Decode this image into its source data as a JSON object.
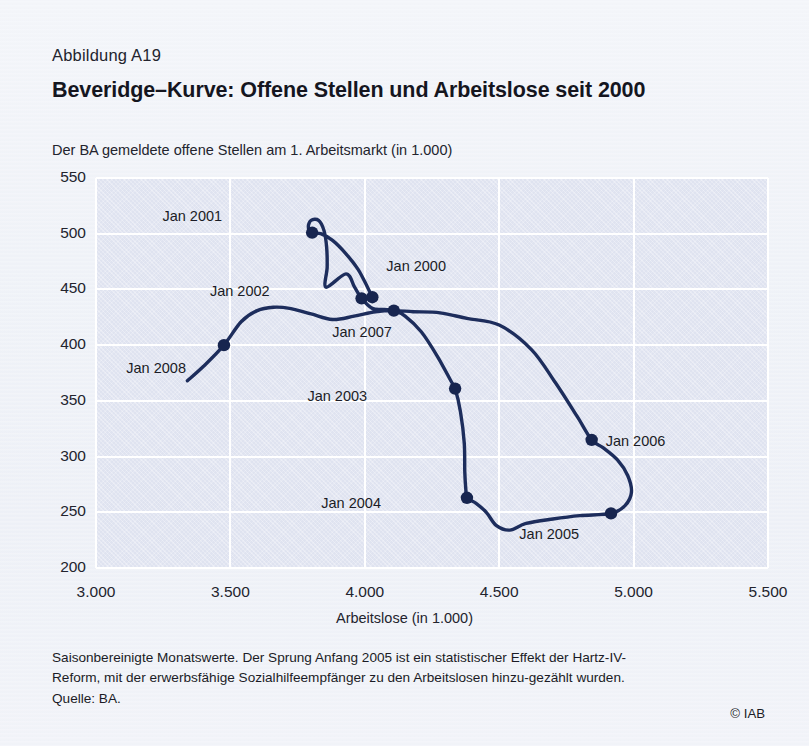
{
  "figure": {
    "number": "Abbildung A19",
    "title": "Beveridge–Kurve: Offene Stellen und Arbeitslose seit 2000",
    "y_axis_title": "Der BA gemeldete offene Stellen am 1. Arbeitsmarkt (in 1.000)",
    "x_axis_title": "Arbeitslose (in 1.000)",
    "footnote_line1": "Saisonbereinigte Monatswerte. Der Sprung Anfang 2005 ist ein statistischer Effekt der Hartz-IV-",
    "footnote_line2": "Reform, mit der erwerbsfähige Sozialhilfeempfänger zu den Arbeitslosen hinzu-gezählt wurden.",
    "source": "Quelle: BA.",
    "copyright": "© IAB"
  },
  "colors": {
    "curve": "#1d2d5c",
    "marker": "#17254f",
    "plot_background": "#dfe3f0",
    "gridline": "#ffffff",
    "page_background": "#eef1f7",
    "text": "#1b1c26"
  },
  "chart_data": {
    "type": "line",
    "title": "Beveridge–Kurve: Offene Stellen und Arbeitslose seit 2000",
    "xlabel": "Arbeitslose (in 1.000)",
    "ylabel": "Der BA gemeldete offene Stellen am 1. Arbeitsmarkt (in 1.000)",
    "xlim": [
      3000,
      5500
    ],
    "ylim": [
      200,
      550
    ],
    "xticks": [
      "3.000",
      "3.500",
      "4.000",
      "4.500",
      "5.000",
      "5.500"
    ],
    "xtick_values": [
      3000,
      3500,
      4000,
      4500,
      5000,
      5500
    ],
    "yticks": [
      "200",
      "250",
      "300",
      "350",
      "400",
      "450",
      "500",
      "550"
    ],
    "ytick_values": [
      200,
      250,
      300,
      350,
      400,
      450,
      500,
      550
    ],
    "grid": true,
    "legend": "none",
    "series": [
      {
        "name": "Beveridge-Kurve (Monatswerte 2000–2008)",
        "points": [
          {
            "x": 4028,
            "y": 443
          },
          {
            "x": 4010,
            "y": 452
          },
          {
            "x": 3975,
            "y": 468
          },
          {
            "x": 3930,
            "y": 482
          },
          {
            "x": 3880,
            "y": 494
          },
          {
            "x": 3836,
            "y": 500
          },
          {
            "x": 3804,
            "y": 501
          },
          {
            "x": 3790,
            "y": 506
          },
          {
            "x": 3800,
            "y": 512
          },
          {
            "x": 3828,
            "y": 512
          },
          {
            "x": 3848,
            "y": 503
          },
          {
            "x": 3858,
            "y": 488
          },
          {
            "x": 3860,
            "y": 470
          },
          {
            "x": 3856,
            "y": 452
          },
          {
            "x": 3930,
            "y": 464
          },
          {
            "x": 3962,
            "y": 452
          },
          {
            "x": 3988,
            "y": 442
          },
          {
            "x": 4028,
            "y": 433
          },
          {
            "x": 4070,
            "y": 432
          },
          {
            "x": 4108,
            "y": 431
          },
          {
            "x": 4150,
            "y": 426
          },
          {
            "x": 4210,
            "y": 412
          },
          {
            "x": 4270,
            "y": 390
          },
          {
            "x": 4320,
            "y": 368
          },
          {
            "x": 4336,
            "y": 361
          },
          {
            "x": 4356,
            "y": 340
          },
          {
            "x": 4370,
            "y": 312
          },
          {
            "x": 4372,
            "y": 286
          },
          {
            "x": 4376,
            "y": 270
          },
          {
            "x": 4380,
            "y": 263
          },
          {
            "x": 4414,
            "y": 258
          },
          {
            "x": 4452,
            "y": 250
          },
          {
            "x": 4490,
            "y": 238
          },
          {
            "x": 4540,
            "y": 234
          },
          {
            "x": 4600,
            "y": 240
          },
          {
            "x": 4700,
            "y": 244
          },
          {
            "x": 4800,
            "y": 247
          },
          {
            "x": 4916,
            "y": 249
          },
          {
            "x": 4968,
            "y": 256
          },
          {
            "x": 4992,
            "y": 268
          },
          {
            "x": 4978,
            "y": 283
          },
          {
            "x": 4940,
            "y": 297
          },
          {
            "x": 4886,
            "y": 308
          },
          {
            "x": 4844,
            "y": 315
          },
          {
            "x": 4790,
            "y": 336
          },
          {
            "x": 4710,
            "y": 366
          },
          {
            "x": 4620,
            "y": 396
          },
          {
            "x": 4500,
            "y": 418
          },
          {
            "x": 4380,
            "y": 424
          },
          {
            "x": 4280,
            "y": 429
          },
          {
            "x": 4180,
            "y": 430
          },
          {
            "x": 4108,
            "y": 431
          },
          {
            "x": 4040,
            "y": 430
          },
          {
            "x": 3960,
            "y": 426
          },
          {
            "x": 3880,
            "y": 423
          },
          {
            "x": 3800,
            "y": 428
          },
          {
            "x": 3720,
            "y": 433
          },
          {
            "x": 3660,
            "y": 434
          },
          {
            "x": 3600,
            "y": 431
          },
          {
            "x": 3540,
            "y": 421
          },
          {
            "x": 3476,
            "y": 400
          },
          {
            "x": 3400,
            "y": 381
          },
          {
            "x": 3340,
            "y": 368
          }
        ]
      }
    ],
    "annotated_points": [
      {
        "label": "Jan 2000",
        "x": 4028,
        "y": 443,
        "label_dx": 14,
        "label_dy": -30
      },
      {
        "label": "Jan 2001",
        "x": 3804,
        "y": 501,
        "label_dx": -90,
        "label_dy": -16
      },
      {
        "label": "Jan 2002",
        "x": 3988,
        "y": 442,
        "label_dx": -92,
        "label_dy": -6
      },
      {
        "label": "Jan 2003",
        "x": 4336,
        "y": 361,
        "label_dx": -88,
        "label_dy": 8
      },
      {
        "label": "Jan 2004",
        "x": 4380,
        "y": 263,
        "label_dx": -86,
        "label_dy": 6
      },
      {
        "label": "Jan 2005",
        "x": 4916,
        "y": 249,
        "label_dx": -32,
        "label_dy": 22
      },
      {
        "label": "Jan 2006",
        "x": 4844,
        "y": 315,
        "label_dx": 14,
        "label_dy": 2
      },
      {
        "label": "Jan 2007",
        "x": 4108,
        "y": 431,
        "label_dx": -2,
        "label_dy": 22
      },
      {
        "label": "Jan 2008",
        "x": 3476,
        "y": 400,
        "label_dx": -38,
        "label_dy": 24
      }
    ]
  }
}
